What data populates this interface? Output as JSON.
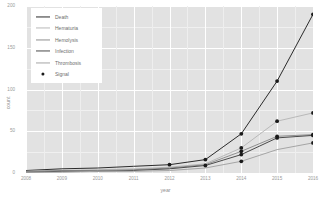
{
  "chart_data": {
    "type": "line",
    "title": "",
    "xlabel": "year",
    "ylabel": "count",
    "xlim": [
      2008,
      2016
    ],
    "ylim": [
      0,
      200
    ],
    "x": [
      2008,
      2009,
      2010,
      2011,
      2012,
      2013,
      2014,
      2015,
      2016
    ],
    "xticklabels": [
      "2008",
      "2009",
      "2010",
      "2011",
      "2012",
      "2013",
      "2014",
      "2015",
      "2016"
    ],
    "yticks": [
      0,
      50,
      100,
      150,
      200
    ],
    "yticklabels": [
      "0",
      "50",
      "100",
      "150",
      "200"
    ],
    "grid": true,
    "legend_position": "top-left",
    "panel_background": "#e2e2e2",
    "gridline_color": "#ffffff",
    "series": [
      {
        "name": "Death",
        "color": "#2b2b2b",
        "values": [
          3,
          5,
          6,
          8,
          10,
          16,
          47,
          110,
          190
        ],
        "signal_points": [
          2012,
          2013,
          2014,
          2015,
          2016
        ]
      },
      {
        "name": "Hematuria",
        "color": "#b9b9b9",
        "values": [
          2,
          3,
          4,
          5,
          7,
          11,
          30,
          62,
          72
        ],
        "signal_points": [
          2014,
          2015,
          2016
        ]
      },
      {
        "name": "Hemolysis",
        "color": "#8f8f8f",
        "values": [
          2,
          3,
          3,
          4,
          6,
          10,
          26,
          44,
          46
        ],
        "signal_points": [
          2014,
          2015,
          2016
        ]
      },
      {
        "name": "Infection",
        "color": "#4a4a4a",
        "values": [
          1,
          2,
          2,
          3,
          5,
          9,
          22,
          42,
          45
        ],
        "signal_points": [
          2013,
          2014,
          2015,
          2016
        ]
      },
      {
        "name": "Thrombosis",
        "color": "#a5a5a5",
        "values": [
          1,
          1,
          2,
          2,
          3,
          6,
          14,
          28,
          36
        ],
        "signal_points": [
          2014,
          2016
        ]
      }
    ],
    "signal_marker": {
      "name": "Signal",
      "color": "#1a1a1a",
      "shape": "circle"
    }
  },
  "legend": {
    "entries": [
      {
        "label": "Death",
        "color": "#2b2b2b",
        "type": "line"
      },
      {
        "label": "Hematuria",
        "color": "#b9b9b9",
        "type": "line"
      },
      {
        "label": "Hemolysis",
        "color": "#8f8f8f",
        "type": "line"
      },
      {
        "label": "Infection",
        "color": "#4a4a4a",
        "type": "line"
      },
      {
        "label": "Thrombosis",
        "color": "#a5a5a5",
        "type": "line"
      },
      {
        "label": "Signal",
        "color": "#1a1a1a",
        "type": "point"
      }
    ]
  }
}
